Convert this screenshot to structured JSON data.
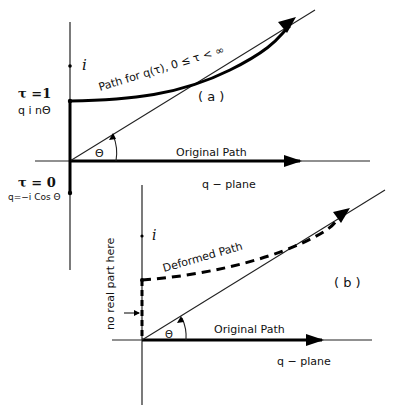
{
  "diagram_a": {
    "label": "( a )",
    "path_label": "Path for  q(τ),  0 ≤ τ < ∞",
    "tau1": "τ =1",
    "tau1_q": "q  i    nΘ",
    "tau0": "τ = 0",
    "tau0_q": "q=−i Cos Θ",
    "i_label": "i",
    "theta": "Θ",
    "original_path": "Original  Path",
    "plane": "q  −  plane"
  },
  "diagram_b": {
    "label": "( b )",
    "path_label": "Deformed  Path",
    "i_label": "i",
    "theta": "Θ",
    "original_path": "Original  Path",
    "plane": "q  − plane",
    "note": "no  real  part  here"
  }
}
